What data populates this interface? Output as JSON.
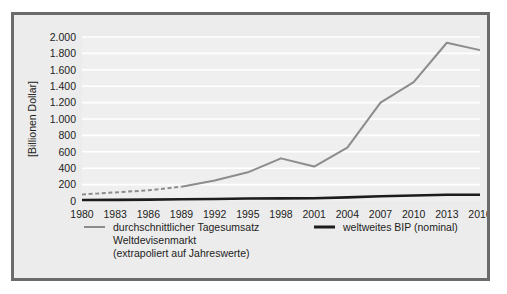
{
  "chart_data": {
    "type": "line",
    "title": "",
    "xlabel": "",
    "ylabel": "[Billionen Dollar]",
    "ylim": [
      0,
      2000
    ],
    "ytick_labels": [
      "0",
      "200",
      "400",
      "600",
      "800",
      "1.000",
      "1.200",
      "1.400",
      "1.600",
      "1.800",
      "2.000"
    ],
    "ytick_values": [
      0,
      200,
      400,
      600,
      800,
      1000,
      1200,
      1400,
      1600,
      1800,
      2000
    ],
    "grid": true,
    "grid_color": "#ffffff",
    "plot_background": "#efeff0",
    "legend_position": "below",
    "categories": [
      "1980",
      "1983",
      "1986",
      "1989",
      "1992",
      "1995",
      "1998",
      "2001",
      "2004",
      "2007",
      "2010",
      "2013",
      "2016"
    ],
    "x": [
      1980,
      1983,
      1986,
      1989,
      1992,
      1995,
      1998,
      2001,
      2004,
      2007,
      2010,
      2013,
      2016
    ],
    "series": [
      {
        "name": "durchschnittlicher Tagesumsatz Weltdevisenmarkt (extrapoliert auf Jahreswerte)",
        "color": "#8c8c8c",
        "style_segments": [
          {
            "style": "dashed",
            "from_index": 0,
            "to_index": 3
          },
          {
            "style": "solid",
            "from_index": 3,
            "to_index": 12
          }
        ],
        "values": [
          80,
          105,
          130,
          175,
          250,
          350,
          520,
          420,
          650,
          1200,
          1450,
          1930,
          1840
        ]
      },
      {
        "name": "weltweites BIP (nominal)",
        "color": "#1d1d1b",
        "style_segments": [
          {
            "style": "solid",
            "from_index": 0,
            "to_index": 12
          }
        ],
        "values": [
          12,
          14,
          17,
          21,
          25,
          31,
          32,
          34,
          44,
          58,
          67,
          77,
          76
        ]
      }
    ],
    "legend_entries": [
      {
        "label_lines": [
          "durchschnittlicher Tagesumsatz",
          "Weltdevisenmarkt",
          "(extrapoliert auf Jahreswerte)"
        ],
        "color": "#8c8c8c",
        "line_weight": "thin"
      },
      {
        "label_lines": [
          "weltweites BIP (nominal)"
        ],
        "color": "#1d1d1b",
        "line_weight": "thick"
      }
    ]
  }
}
